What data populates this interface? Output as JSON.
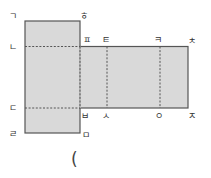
{
  "figure": {
    "type": "net-of-rectangular-prism",
    "colors": {
      "fill": "#d9d9d9",
      "edge": "#555555",
      "fold": "#555555",
      "label": "#333333"
    },
    "vertex_labels": {
      "top_left": "ㄱ",
      "top_right_of_tall_face": "ㅎ",
      "left_upper_fold": "ㄴ",
      "left_lower_fold": "ㄷ",
      "bottom_left": "ㄹ",
      "bottom_right_of_tall_face": "ㅁ",
      "strip_top_1": "ㅍ",
      "strip_top_2": "ㅌ",
      "strip_top_3": "ㅋ",
      "strip_top_right": "ㅊ",
      "strip_bottom_1": "ㅂ",
      "strip_bottom_2": "ㅅ",
      "strip_bottom_3": "ㅇ",
      "strip_bottom_right": "ㅈ"
    },
    "answer_blank": "("
  }
}
